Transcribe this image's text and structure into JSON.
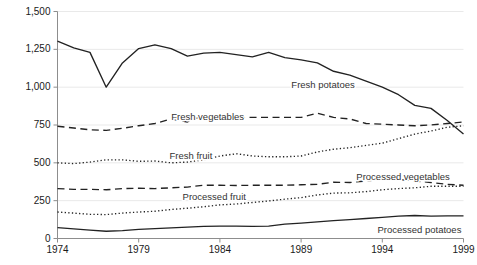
{
  "chart_data": {
    "type": "line",
    "title": "",
    "subtitle": "",
    "xlabel": "",
    "ylabel": "",
    "xlim": [
      1974,
      1999
    ],
    "ylim": [
      0,
      1500
    ],
    "grid": true,
    "legend": "inline-labels",
    "y_ticks": [
      0,
      250,
      500,
      750,
      1000,
      1250,
      1500
    ],
    "y_tick_labels": [
      "0",
      "250",
      "500",
      "750",
      "1,000",
      "1,250",
      "1,500"
    ],
    "x_ticks": [
      1974,
      1979,
      1984,
      1989,
      1994,
      1999
    ],
    "x_tick_labels": [
      "1974",
      "1979",
      "1984",
      "1989",
      "1994",
      "1999"
    ],
    "x": [
      1974,
      1975,
      1976,
      1977,
      1978,
      1979,
      1980,
      1981,
      1982,
      1983,
      1984,
      1985,
      1986,
      1987,
      1988,
      1989,
      1990,
      1991,
      1992,
      1993,
      1994,
      1995,
      1996,
      1997,
      1998,
      1999
    ],
    "series": [
      {
        "name": "Fresh potatoes",
        "style": "solid",
        "label_x": 1988.4,
        "label_y": 1010,
        "values": [
          1305,
          1260,
          1230,
          1000,
          1160,
          1255,
          1280,
          1255,
          1205,
          1225,
          1230,
          1215,
          1200,
          1230,
          1195,
          1180,
          1160,
          1105,
          1080,
          1040,
          1000,
          950,
          880,
          860,
          780,
          690
        ]
      },
      {
        "name": "Fresh vegetables",
        "style": "dashed",
        "label_x": 1981.0,
        "label_y": 800,
        "values": [
          742,
          730,
          718,
          715,
          728,
          745,
          760,
          790,
          770,
          815,
          790,
          800,
          800,
          800,
          800,
          800,
          828,
          800,
          790,
          760,
          755,
          750,
          745,
          750,
          760,
          770
        ]
      },
      {
        "name": "Fresh fruit",
        "style": "dotted",
        "label_x": 1980.9,
        "label_y": 545,
        "values": [
          500,
          495,
          505,
          520,
          520,
          510,
          512,
          500,
          505,
          520,
          545,
          560,
          545,
          540,
          540,
          545,
          572,
          590,
          600,
          615,
          630,
          660,
          690,
          710,
          735,
          745
        ]
      },
      {
        "name": "Processed vegetables",
        "style": "dashed",
        "label_x": 1992.4,
        "label_y": 405,
        "values": [
          330,
          325,
          325,
          322,
          330,
          332,
          330,
          335,
          340,
          352,
          352,
          350,
          352,
          352,
          352,
          355,
          358,
          372,
          370,
          380,
          392,
          390,
          380,
          370,
          358,
          352
        ]
      },
      {
        "name": "Processed fruit",
        "style": "dotted",
        "label_x": 1981.7,
        "label_y": 272,
        "values": [
          175,
          168,
          160,
          158,
          168,
          175,
          180,
          192,
          200,
          210,
          222,
          228,
          238,
          248,
          260,
          270,
          288,
          300,
          302,
          310,
          322,
          330,
          335,
          345,
          345,
          345
        ]
      },
      {
        "name": "Processed potatoes",
        "style": "solid",
        "label_x": 1993.7,
        "label_y": 50,
        "values": [
          72,
          64,
          55,
          48,
          52,
          60,
          65,
          70,
          75,
          80,
          82,
          82,
          80,
          82,
          95,
          102,
          110,
          118,
          125,
          132,
          140,
          148,
          152,
          148,
          150,
          150
        ]
      }
    ]
  }
}
